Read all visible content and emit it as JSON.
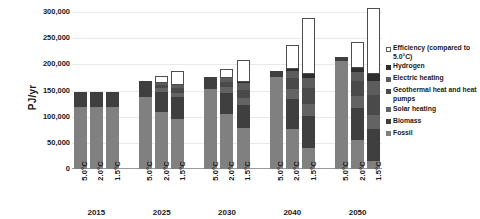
{
  "chart_data": {
    "type": "bar",
    "subtype": "stacked-bar",
    "title": "",
    "xlabel": "",
    "ylabel": "PJ/yr",
    "ylim": [
      0,
      300000
    ],
    "ytick_step": 50000,
    "ytick_labels": [
      "300,000",
      "250,000",
      "200,000",
      "150,000",
      "100,000",
      "50,000",
      "0"
    ],
    "ytick_values": [
      300000,
      250000,
      200000,
      150000,
      100000,
      50000,
      0
    ],
    "grid": true,
    "legend_position": "right",
    "group_labels": [
      "2015",
      "2025",
      "2030",
      "2040",
      "2050"
    ],
    "scenario_labels": [
      "5.0°C",
      "2.0°C",
      "1.5°C"
    ],
    "categories": [
      "2015 5.0°C",
      "2015 2.0°C",
      "2015 1.5°C",
      "2025 5.0°C",
      "2025 2.0°C",
      "2025 1.5°C",
      "2030 5.0°C",
      "2030 2.0°C",
      "2030 1.5°C",
      "2040 5.0°C",
      "2040 2.0°C",
      "2040 1.5°C",
      "2050 5.0°C",
      "2050 2.0°C",
      "2050 1.5°C"
    ],
    "series": [
      {
        "name": "Fossil",
        "color": "#808080",
        "values": [
          118000,
          118000,
          118000,
          138000,
          108000,
          96000,
          152000,
          106000,
          78000,
          176000,
          76000,
          40000,
          206000,
          56000,
          16000
        ]
      },
      {
        "name": "Biomass",
        "color": "#3f3f3f",
        "values": [
          30000,
          30000,
          30000,
          30000,
          40000,
          42000,
          24000,
          40000,
          44000,
          12000,
          58000,
          62000,
          8000,
          60000,
          60000
        ]
      },
      {
        "name": "Solar heating",
        "color": "#636363",
        "values": [
          0,
          0,
          0,
          0,
          6000,
          8000,
          0,
          10000,
          14000,
          0,
          18000,
          22000,
          0,
          24000,
          28000
        ]
      },
      {
        "name": "Geothermal heat and heat pumps",
        "color": "#4a4a4a",
        "values": [
          0,
          0,
          0,
          0,
          6000,
          8000,
          0,
          10000,
          16000,
          0,
          22000,
          30000,
          0,
          28000,
          38000
        ]
      },
      {
        "name": "Electric heating",
        "color": "#5c5c5c",
        "values": [
          0,
          0,
          0,
          0,
          4000,
          6000,
          0,
          8000,
          12000,
          0,
          14000,
          20000,
          0,
          18000,
          26000
        ]
      },
      {
        "name": "Hydrogen",
        "color": "#2e2e2e",
        "values": [
          0,
          0,
          0,
          0,
          0,
          0,
          0,
          0,
          2000,
          0,
          4000,
          8000,
          0,
          8000,
          14000
        ]
      },
      {
        "name": "Efficiency (compared to 5.0°C)",
        "color": "#ffffff",
        "outline": true,
        "values": [
          0,
          0,
          0,
          0,
          14000,
          28000,
          0,
          18000,
          42000,
          0,
          46000,
          106000,
          0,
          48000,
          126000
        ]
      }
    ],
    "totals": [
      148000,
      148000,
      148000,
      168000,
      178000,
      188000,
      176000,
      192000,
      208000,
      188000,
      238000,
      288000,
      214000,
      242000,
      308000
    ]
  },
  "legend": {
    "items": [
      {
        "label": "Efficiency (compared to 5.0°C)",
        "color": "#ffffff",
        "outline": true
      },
      {
        "label": "Hydrogen",
        "color": "#2e2e2e",
        "outline": false
      },
      {
        "label": "Electric heating",
        "color": "#5c5c5c",
        "outline": false
      },
      {
        "label": "Geothermal heat and heat pumps",
        "color": "#4a4a4a",
        "outline": false
      },
      {
        "label": "Solar heating",
        "color": "#636363",
        "outline": false
      },
      {
        "label": "Biomass",
        "color": "#3f3f3f",
        "outline": false
      },
      {
        "label": "Fossil",
        "color": "#808080",
        "outline": false
      }
    ]
  }
}
